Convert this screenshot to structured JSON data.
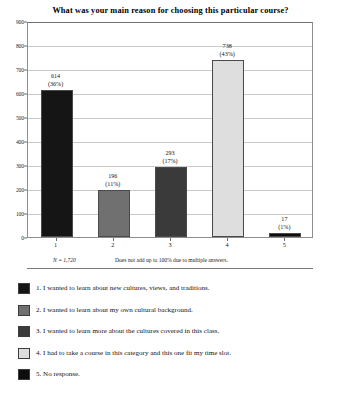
{
  "chart_data": {
    "type": "bar",
    "title": "What was your main reason for choosing this particular course?",
    "xlabel": "",
    "ylabel": "",
    "ylim": [
      0,
      900
    ],
    "ytick_step": 100,
    "grid": true,
    "legend_position": "below",
    "categories": [
      "1",
      "2",
      "3",
      "4",
      "5"
    ],
    "values": [
      614,
      196,
      293,
      738,
      17
    ],
    "percent_labels": [
      "(36%)",
      "(11%)",
      "(17%)",
      "(43%)",
      "(1%)"
    ],
    "value_labels": [
      "614",
      "196",
      "293",
      "738",
      "17"
    ],
    "bar_colors": [
      "#151515",
      "#707070",
      "#3a3a3a",
      "#dedede",
      "#0d0d0d"
    ],
    "ytick_labels": [
      "0",
      "100",
      "200",
      "300",
      "400",
      "500",
      "600",
      "700",
      "800",
      "900"
    ],
    "annotations": {
      "sample_size": "N = 1,720",
      "note": "Does not add up to 100% due to multiple answers."
    },
    "legend": [
      {
        "marker": "legend-swatch-1",
        "label": "1. I wanted to learn about new cultures, views, and traditions.",
        "color": "#151515"
      },
      {
        "marker": "legend-swatch-2",
        "label": "2. I wanted to learn about my own cultural background.",
        "color": "#707070"
      },
      {
        "marker": "legend-swatch-3",
        "label": "3. I wanted to learn more about the cultures covered in this class.",
        "color": "#3a3a3a"
      },
      {
        "marker": "legend-swatch-4",
        "label": "4. I had to take a course in this category and this one fit my time slot.",
        "color": "#dedede"
      },
      {
        "marker": "legend-swatch-5",
        "label": "5. No response.",
        "color": "#0d0d0d"
      }
    ]
  }
}
